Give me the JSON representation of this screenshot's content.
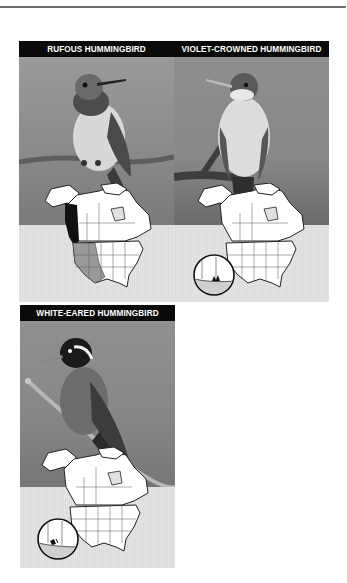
{
  "page": {
    "rule_color": "#6e6e6e"
  },
  "panels": [
    {
      "title": "RUFOUS HUMMINGBIRD",
      "photo": "hummingbird perched on branch, white breast, dark throat",
      "map": {
        "region": "North America",
        "range_breeding": "Pacific Northwest to Alaska (black)",
        "range_migration": "Western US (gray)",
        "inset": false
      }
    },
    {
      "title": "VIOLET-CROWNED HUMMINGBIRD",
      "photo": "hummingbird perched on branch, white breast, long bill",
      "map": {
        "region": "North America",
        "range": "SE Arizona / SW New Mexico border",
        "inset": true
      }
    },
    {
      "title": "WHITE-EARED HUMMINGBIRD",
      "photo": "hummingbird with white ear stripe perched on twig",
      "map": {
        "region": "North America",
        "range": "SE Arizona mountains",
        "inset": true
      }
    }
  ],
  "colors": {
    "header_bg": "#0a0a0a",
    "header_text": "#ffffff",
    "photo_bg": "#8a8a8a",
    "map_bg": "#e0e0e0",
    "range_dark": "#111111",
    "range_gray": "#9a9a9a"
  }
}
